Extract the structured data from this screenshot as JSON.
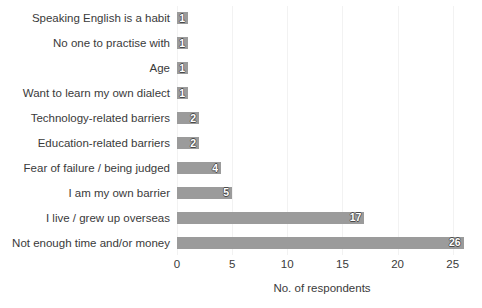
{
  "chart_data": {
    "type": "bar",
    "orientation": "horizontal",
    "title": "",
    "xlabel": "No. of respondents",
    "ylabel": "",
    "xlim": [
      0,
      26.3
    ],
    "xticks": [
      0,
      5,
      10,
      15,
      20,
      25
    ],
    "xtick_labels": [
      "0",
      "5",
      "10",
      "15",
      "20",
      "25"
    ],
    "grid": "vertical",
    "legend": "none",
    "bar_color": "#9b9b9b",
    "categories": [
      "Speaking English is a habit",
      "No one to practise with",
      "Age",
      "Want to learn my own dialect",
      "Technology-related barriers",
      "Education-related barriers",
      "Fear of failure / being judged",
      "I am my own barrier",
      "I live / grew up overseas",
      "Not enough time and/or money"
    ],
    "values": [
      1,
      1,
      1,
      1,
      2,
      2,
      4,
      5,
      17,
      26
    ],
    "data_labels": [
      "1",
      "1",
      "1",
      "1",
      "2",
      "2",
      "4",
      "5",
      "17",
      "26"
    ]
  }
}
